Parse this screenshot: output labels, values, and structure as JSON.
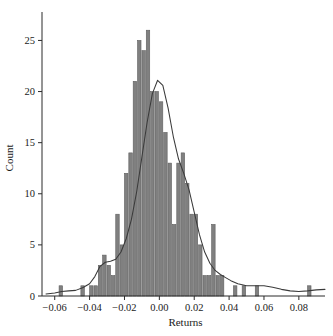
{
  "chart_data": {
    "type": "bar",
    "title": "",
    "subtitle": "",
    "xlabel": "Returns",
    "ylabel": "Count",
    "xlim": [
      -0.065,
      0.095
    ],
    "ylim": [
      0,
      27
    ],
    "grid": false,
    "legend": null,
    "bin_width": 0.0025,
    "xticks": [
      -0.06,
      -0.04,
      -0.02,
      0.0,
      0.02,
      0.04,
      0.06,
      0.08
    ],
    "xtick_labels": [
      "−0.06",
      "−0.04",
      "−0.02",
      "0.00",
      "0.02",
      "0.04",
      "0.06",
      "0.08"
    ],
    "yticks": [
      0,
      5,
      10,
      15,
      20,
      25
    ],
    "ytick_labels": [
      "0",
      "5",
      "10",
      "15",
      "20",
      "25"
    ],
    "bar_color": "#808080",
    "bar_edge_color": "#5e5e5e",
    "curve_color": "#3a3a3a",
    "bin_centers": [
      -0.05625,
      -0.05375,
      -0.05125,
      -0.04875,
      -0.04625,
      -0.04375,
      -0.04125,
      -0.03875,
      -0.03625,
      -0.03375,
      -0.03125,
      -0.02875,
      -0.02625,
      -0.02375,
      -0.02125,
      -0.01875,
      -0.01625,
      -0.01375,
      -0.01125,
      -0.00875,
      -0.00625,
      -0.00375,
      -0.00125,
      0.00125,
      0.00375,
      0.00625,
      0.00875,
      0.01125,
      0.01375,
      0.01625,
      0.01875,
      0.02125,
      0.02375,
      0.02625,
      0.02875,
      0.03125,
      0.03375,
      0.03625,
      0.03875,
      0.04125,
      0.04375,
      0.04625,
      0.04875,
      0.05125,
      0.05375,
      0.05625,
      0.05875,
      0.06125,
      0.06375,
      0.06625,
      0.06875,
      0.07125,
      0.07375,
      0.07625,
      0.07875,
      0.08125,
      0.08375,
      0.08625
    ],
    "counts": [
      1,
      0,
      0,
      0,
      0,
      1,
      0,
      1,
      1,
      3,
      4,
      3,
      2,
      8,
      5,
      12,
      14,
      21,
      25,
      24,
      26,
      20,
      20,
      19,
      16,
      13,
      7,
      13,
      14,
      11,
      8,
      8,
      5,
      2,
      2,
      7,
      2,
      2,
      0,
      0,
      1,
      0,
      1,
      0,
      0,
      1,
      0,
      0,
      0,
      0,
      0,
      0,
      0,
      0,
      0,
      0,
      0,
      1
    ],
    "density_curve": {
      "description": "kernel density estimate scaled to count axis",
      "x": [
        -0.065,
        -0.06,
        -0.056,
        -0.052,
        -0.048,
        -0.044,
        -0.04,
        -0.037,
        -0.034,
        -0.031,
        -0.028,
        -0.025,
        -0.022,
        -0.019,
        -0.016,
        -0.013,
        -0.01,
        -0.007,
        -0.004,
        -0.001,
        0.002,
        0.005,
        0.008,
        0.011,
        0.014,
        0.017,
        0.02,
        0.023,
        0.026,
        0.029,
        0.032,
        0.035,
        0.038,
        0.041,
        0.045,
        0.05,
        0.055,
        0.06,
        0.065,
        0.07,
        0.075,
        0.08,
        0.085,
        0.09,
        0.095
      ],
      "y": [
        0.2,
        0.3,
        0.45,
        0.5,
        0.55,
        0.8,
        1.2,
        1.9,
        2.9,
        3.3,
        3.4,
        3.6,
        4.3,
        5.6,
        7.5,
        10.2,
        13.6,
        17.0,
        19.8,
        21.1,
        20.6,
        18.4,
        15.6,
        13.4,
        12.0,
        10.4,
        8.2,
        6.0,
        4.3,
        3.2,
        2.5,
        2.1,
        1.8,
        1.5,
        1.2,
        1.0,
        1.0,
        1.0,
        0.85,
        0.65,
        0.5,
        0.45,
        0.5,
        0.6,
        0.65
      ]
    }
  }
}
